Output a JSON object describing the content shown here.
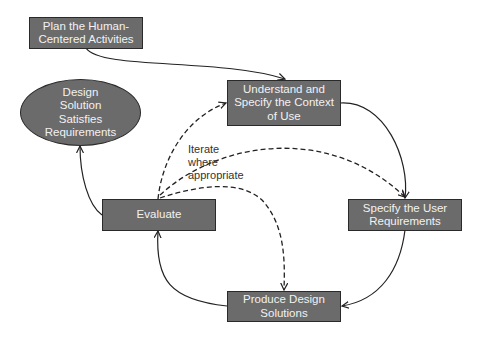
{
  "diagram": {
    "type": "process-cycle",
    "nodes": {
      "plan": {
        "label": "Plan the Human-\nCentered Activities",
        "shape": "rectangle"
      },
      "understand": {
        "label": "Understand and\nSpecify the Context\nof Use",
        "shape": "rectangle"
      },
      "specify": {
        "label": "Specify the User\nRequirements",
        "shape": "rectangle"
      },
      "produce": {
        "label": "Produce Design\nSolutions",
        "shape": "rectangle"
      },
      "evaluate": {
        "label": "Evaluate",
        "shape": "rectangle"
      },
      "satisfies": {
        "label": "Design\nSolution\nSatisfies\nRequirements",
        "shape": "ellipse"
      }
    },
    "edges": [
      {
        "from": "plan",
        "to": "understand",
        "style": "solid"
      },
      {
        "from": "understand",
        "to": "specify",
        "style": "solid"
      },
      {
        "from": "specify",
        "to": "produce",
        "style": "solid"
      },
      {
        "from": "produce",
        "to": "evaluate",
        "style": "solid"
      },
      {
        "from": "evaluate",
        "to": "satisfies",
        "style": "solid"
      },
      {
        "from": "evaluate",
        "to": "understand",
        "style": "dashed"
      },
      {
        "from": "evaluate",
        "to": "specify",
        "style": "dashed"
      },
      {
        "from": "evaluate",
        "to": "produce",
        "style": "dashed"
      }
    ],
    "annotation": "Iterate\nwhere\nappropriate",
    "colors": {
      "node_fill": "#6b6b6b",
      "node_border": "#2a2a2a",
      "node_text": "#f2f2f2",
      "edge": "#222222"
    }
  }
}
